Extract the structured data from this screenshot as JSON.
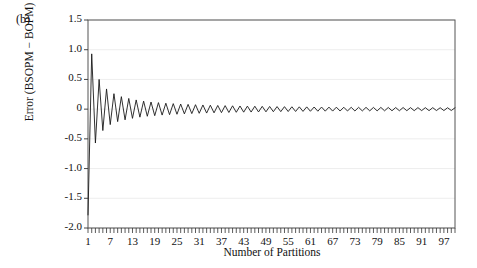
{
  "panel": {
    "label": "(b)"
  },
  "chart_data": {
    "type": "line",
    "title": "",
    "subtitle": "",
    "panel_label": "(b)",
    "xlabel": "Number of Partitions",
    "ylabel": "Error (BSOPM − BOPM)",
    "xlim": [
      1,
      100
    ],
    "ylim": [
      -2.0,
      1.5
    ],
    "grid": true,
    "grid_axis": "y",
    "legend": null,
    "line_color": "#1a1a1a",
    "line_width": 0.9,
    "x_major_ticks": [
      1,
      7,
      13,
      19,
      25,
      31,
      37,
      43,
      49,
      55,
      61,
      67,
      73,
      79,
      85,
      91,
      97
    ],
    "x_major_tick_labels": [
      "1",
      "7",
      "13",
      "19",
      "25",
      "31",
      "37",
      "43",
      "49",
      "55",
      "61",
      "67",
      "73",
      "79",
      "85",
      "91",
      "97"
    ],
    "x_minor_tick_step": 1,
    "y_ticks": [
      1.5,
      1.0,
      0.5,
      0,
      -0.5,
      -1.0,
      -1.5,
      -2.0
    ],
    "y_tick_labels": [
      "1.5",
      "1.0",
      "0.5",
      "0",
      "-0.5",
      "-1.0",
      "-1.5",
      "-2.0"
    ],
    "series": [
      {
        "name": "Error (BSOPM - BOPM)",
        "x": [
          1,
          2,
          3,
          4,
          5,
          6,
          7,
          8,
          9,
          10,
          11,
          12,
          13,
          14,
          15,
          16,
          17,
          18,
          19,
          20,
          21,
          22,
          23,
          24,
          25,
          26,
          27,
          28,
          29,
          30,
          31,
          32,
          33,
          34,
          35,
          36,
          37,
          38,
          39,
          40,
          41,
          42,
          43,
          44,
          45,
          46,
          47,
          48,
          49,
          50,
          51,
          52,
          53,
          54,
          55,
          56,
          57,
          58,
          59,
          60,
          61,
          62,
          63,
          64,
          65,
          66,
          67,
          68,
          69,
          70,
          71,
          72,
          73,
          74,
          75,
          76,
          77,
          78,
          79,
          80,
          81,
          82,
          83,
          84,
          85,
          86,
          87,
          88,
          89,
          90,
          91,
          92,
          93,
          94,
          95,
          96,
          97,
          98,
          99,
          100
        ],
        "values": [
          -1.78,
          0.93,
          -0.57,
          0.5,
          -0.36,
          0.34,
          -0.26,
          0.26,
          -0.21,
          0.21,
          -0.18,
          0.18,
          -0.155,
          0.155,
          -0.135,
          0.135,
          -0.12,
          0.12,
          -0.11,
          0.11,
          -0.1,
          0.1,
          -0.093,
          0.093,
          -0.086,
          0.086,
          -0.08,
          0.08,
          -0.075,
          0.075,
          -0.07,
          0.07,
          -0.066,
          0.066,
          -0.062,
          0.062,
          -0.059,
          0.059,
          -0.056,
          0.056,
          -0.053,
          0.053,
          -0.051,
          0.051,
          -0.049,
          0.049,
          -0.047,
          0.047,
          -0.045,
          0.045,
          -0.043,
          0.043,
          -0.042,
          0.042,
          -0.04,
          0.04,
          -0.039,
          0.039,
          -0.038,
          0.038,
          -0.036,
          0.036,
          -0.035,
          0.035,
          -0.034,
          0.034,
          -0.033,
          0.033,
          -0.032,
          0.032,
          -0.031,
          0.031,
          -0.031,
          0.031,
          -0.03,
          0.03,
          -0.029,
          0.029,
          -0.029,
          0.029,
          -0.028,
          0.028,
          -0.027,
          0.027,
          -0.027,
          0.027,
          -0.026,
          0.026,
          -0.026,
          0.026,
          -0.025,
          0.025,
          -0.025,
          0.025,
          -0.024,
          0.024,
          -0.024,
          0.024,
          -0.023,
          0.023
        ]
      }
    ]
  }
}
